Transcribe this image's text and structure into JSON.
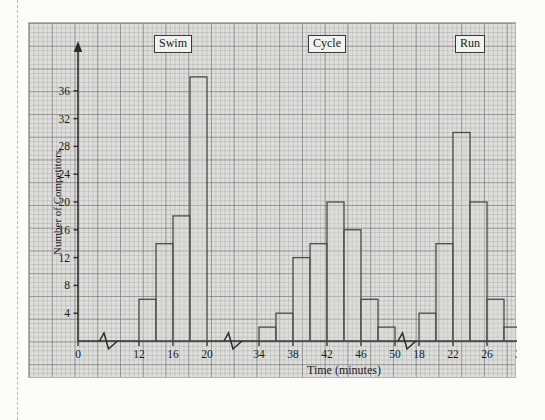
{
  "chart_data": {
    "type": "bar",
    "title": "",
    "xlabel": "Time (minutes)",
    "ylabel": "Number of Competitors",
    "ylim": [
      0,
      40
    ],
    "grid": true,
    "legend_position": "none",
    "y_ticks": [
      4,
      8,
      12,
      16,
      20,
      24,
      28,
      32,
      36
    ],
    "x_break_symbol": "zigzag",
    "sections": [
      {
        "label": "Swim",
        "x_ticks": [
          0,
          12,
          16,
          20
        ],
        "bins": [
          {
            "from": 12,
            "to": 14,
            "value": 6
          },
          {
            "from": 14,
            "to": 16,
            "value": 14
          },
          {
            "from": 16,
            "to": 18,
            "value": 18
          },
          {
            "from": 18,
            "to": 20,
            "value": 38
          }
        ]
      },
      {
        "label": "Cycle",
        "x_ticks": [
          34,
          38,
          42,
          46,
          50
        ],
        "bins": [
          {
            "from": 34,
            "to": 36,
            "value": 2
          },
          {
            "from": 36,
            "to": 38,
            "value": 4
          },
          {
            "from": 38,
            "to": 40,
            "value": 12
          },
          {
            "from": 40,
            "to": 42,
            "value": 14
          },
          {
            "from": 42,
            "to": 44,
            "value": 20
          },
          {
            "from": 44,
            "to": 46,
            "value": 16
          },
          {
            "from": 46,
            "to": 48,
            "value": 6
          },
          {
            "from": 48,
            "to": 50,
            "value": 2
          }
        ]
      },
      {
        "label": "Run",
        "x_ticks": [
          18,
          22,
          26,
          30
        ],
        "bins": [
          {
            "from": 18,
            "to": 20,
            "value": 4
          },
          {
            "from": 20,
            "to": 22,
            "value": 14
          },
          {
            "from": 22,
            "to": 24,
            "value": 30
          },
          {
            "from": 24,
            "to": 26,
            "value": 20
          },
          {
            "from": 26,
            "to": 28,
            "value": 6
          },
          {
            "from": 28,
            "to": 30,
            "value": 2
          }
        ]
      }
    ]
  },
  "colors": {
    "paper_background": "#dededa",
    "page_background": "#fcfcfb",
    "bar_fill": "#d9d9d4",
    "bar_stroke": "#4a4a4a",
    "axis": "#2b2b2b",
    "grid_fine": "#8c8c92",
    "grid_bold": "#6e6e78",
    "text": "#1a1a1a",
    "label_box_fill": "#f2f2ee"
  }
}
